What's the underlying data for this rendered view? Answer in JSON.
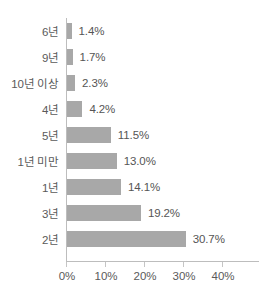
{
  "chart_data": {
    "type": "bar",
    "orientation": "horizontal",
    "title": "",
    "xlabel": "",
    "ylabel": "",
    "xlim": [
      0,
      48
    ],
    "grid": false,
    "legend": null,
    "xticks": [
      "0%",
      "10%",
      "20%",
      "30%",
      "40%"
    ],
    "xtick_values": [
      0,
      10,
      20,
      30,
      40
    ],
    "categories": [
      "6년",
      "9년",
      "10년 이상",
      "4년",
      "5년",
      "1년 미만",
      "1년",
      "3년",
      "2년"
    ],
    "values": [
      1.4,
      1.7,
      2.3,
      4.2,
      11.5,
      13.0,
      14.1,
      19.2,
      30.7
    ],
    "data_labels": [
      "1.4%",
      "1.7%",
      "2.3%",
      "4.2%",
      "11.5%",
      "13.0%",
      "14.1%",
      "19.2%",
      "30.7%"
    ],
    "series": [
      {
        "name": "",
        "values": [
          1.4,
          1.7,
          2.3,
          4.2,
          11.5,
          13.0,
          14.1,
          19.2,
          30.7
        ]
      }
    ],
    "colors": {
      "bar_fill": "#a8a8a8",
      "axis_line": "#bdbdbd",
      "label_text": "#5a5a5a",
      "value_text": "#555555",
      "background": "#ffffff"
    }
  }
}
